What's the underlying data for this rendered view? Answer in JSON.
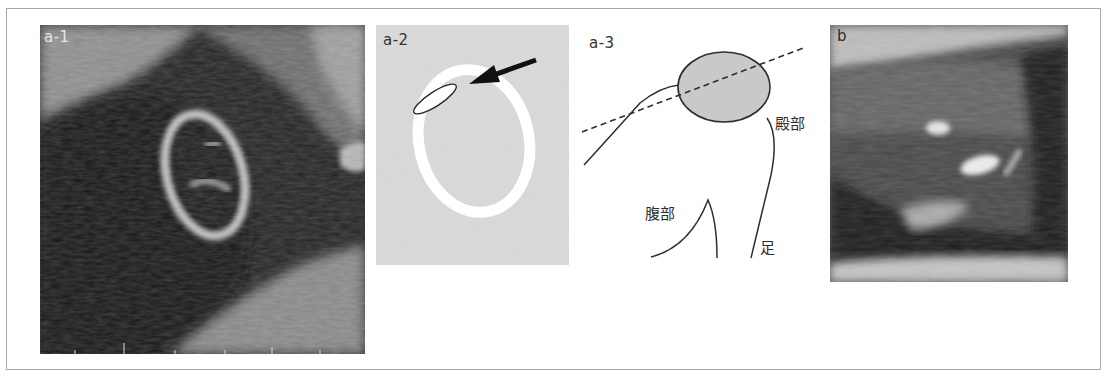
{
  "figure": {
    "panels": [
      {
        "id": "a-1",
        "label": "a-1",
        "type": "ultrasound-image"
      },
      {
        "id": "a-2",
        "label": "a-2",
        "type": "schematic-diagram"
      },
      {
        "id": "a-3",
        "label": "a-3",
        "type": "schematic-diagram",
        "annotations": {
          "buttock": "殿部",
          "abdomen": "腹部",
          "leg": "足"
        }
      },
      {
        "id": "b",
        "label": "b",
        "type": "ultrasound-image"
      }
    ],
    "colors": {
      "frame_border": "#a8a8a8",
      "diagram_gray": "#d6d6d6",
      "ellipse_fill": "#c8c8c8",
      "line": "#2e2e2e"
    }
  }
}
